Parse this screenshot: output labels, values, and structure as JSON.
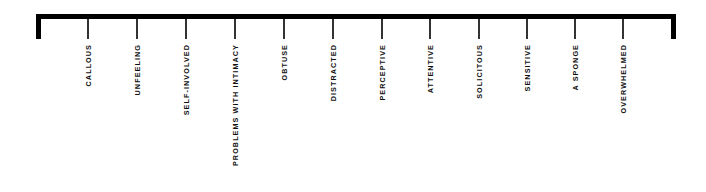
{
  "diagram": {
    "type": "spectrum-scale",
    "colors": {
      "bar": "#000000",
      "tick": "#333333",
      "label": "#111111"
    },
    "ticks": [
      {
        "label": "CALLOUS",
        "x": 88
      },
      {
        "label": "UNFEELING",
        "x": 137
      },
      {
        "label": "SELF-INVOLVED",
        "x": 186
      },
      {
        "label": "PROBLEMS WITH INTIMACY",
        "x": 235
      },
      {
        "label": "OBTUSE",
        "x": 284
      },
      {
        "label": "DISTRACTED",
        "x": 333
      },
      {
        "label": "PERCEPTIVE",
        "x": 382
      },
      {
        "label": "ATTENTIVE",
        "x": 430
      },
      {
        "label": "SOLICITOUS",
        "x": 479
      },
      {
        "label": "SENSITIVE",
        "x": 527
      },
      {
        "label": "A SPONGE",
        "x": 575
      },
      {
        "label": "OVERWHELMED",
        "x": 623
      }
    ]
  }
}
